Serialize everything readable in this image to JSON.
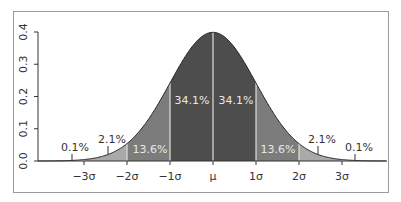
{
  "chart_data": {
    "type": "area",
    "title": "",
    "xlabel": "",
    "ylabel": "",
    "ylim": [
      0.0,
      0.4
    ],
    "xlim": [
      -4,
      4
    ],
    "grid": false,
    "legend": null,
    "y_ticks": [
      "0.0",
      "0.1",
      "0.2",
      "0.3",
      "0.4"
    ],
    "y_tick_values": [
      0.0,
      0.1,
      0.2,
      0.3,
      0.4
    ],
    "x_ticks": [
      "−3σ",
      "−2σ",
      "−1σ",
      "μ",
      "1σ",
      "2σ",
      "3σ"
    ],
    "x_tick_values": [
      -3,
      -2,
      -1,
      0,
      1,
      2,
      3
    ],
    "curve": "standard normal density",
    "regions": [
      {
        "from": -4,
        "to": -3,
        "percent": "0.1%",
        "shade": "light"
      },
      {
        "from": -3,
        "to": -2,
        "percent": "2.1%",
        "shade": "mid-light"
      },
      {
        "from": -2,
        "to": -1,
        "percent": "13.6%",
        "shade": "mid"
      },
      {
        "from": -1,
        "to": 0,
        "percent": "34.1%",
        "shade": "dark"
      },
      {
        "from": 0,
        "to": 1,
        "percent": "34.1%",
        "shade": "dark"
      },
      {
        "from": 1,
        "to": 2,
        "percent": "13.6%",
        "shade": "mid"
      },
      {
        "from": 2,
        "to": 3,
        "percent": "2.1%",
        "shade": "mid-light"
      },
      {
        "from": 3,
        "to": 4,
        "percent": "0.1%",
        "shade": "light"
      }
    ],
    "colors": {
      "dark": "#4d4d4d",
      "mid": "#7c7c7c",
      "mid_light": "#a9a9a9",
      "light": "#cfcfcf",
      "label_inside": "#e8e8e8",
      "label_outside": "#333333",
      "axis": "#333333",
      "divider": "#e0e0e0"
    }
  }
}
